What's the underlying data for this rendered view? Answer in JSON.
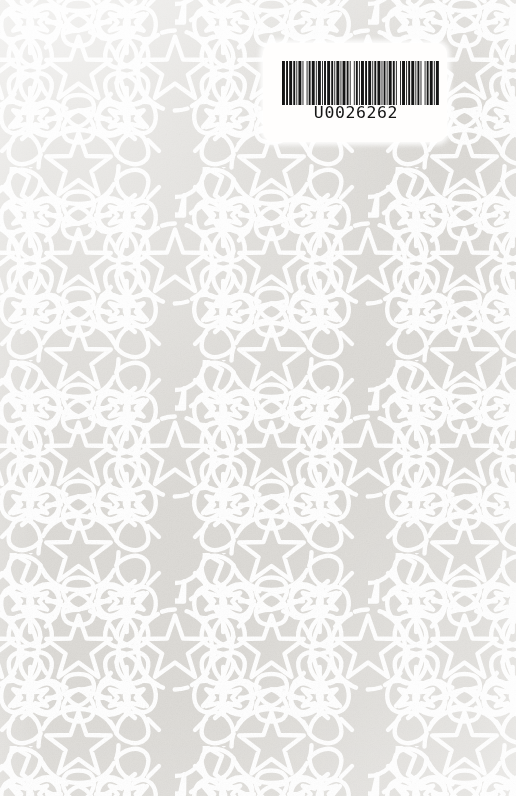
{
  "page": {
    "kind": "book-cover-scan",
    "width": 516,
    "height": 796
  },
  "colors": {
    "paper": "#dddbd7",
    "paper_light": "#e6e4e0",
    "pattern_line": "#ffffff",
    "label_background": "#fffefd",
    "barcode_ink": "#151515"
  },
  "barcode_label": {
    "name": "library-barcode-label",
    "number": "U0026262",
    "prefix_letter": "U",
    "digits": "0026262",
    "symbology": "code-39",
    "bar_widths": [
      3,
      1,
      2,
      1,
      3,
      1,
      2,
      1,
      1,
      1,
      3,
      1,
      1,
      3,
      1,
      1,
      2,
      1,
      3,
      1,
      1,
      1,
      3,
      1,
      1,
      1,
      2,
      1,
      3,
      1,
      2,
      1,
      1,
      1,
      3,
      1,
      1,
      1,
      3,
      1,
      2,
      1,
      1,
      3,
      1,
      1,
      2,
      1,
      1,
      1,
      3,
      1,
      2,
      1,
      3,
      1,
      1,
      1,
      2,
      1,
      3,
      1,
      1,
      1,
      2,
      1,
      1,
      1,
      3,
      1,
      2,
      1,
      1,
      3,
      1,
      1,
      3,
      1,
      1,
      1,
      2,
      1,
      3,
      1,
      1,
      1,
      2,
      1,
      1,
      3,
      1,
      1,
      2,
      1,
      3,
      1,
      1,
      1,
      3
    ]
  },
  "pattern": {
    "name": "girih-decagonal-rosette",
    "description": "Interlaced ten-pointed star rosettes with petal and six-point star fillers",
    "repeat_x": 193,
    "repeat_y": 193,
    "stroke_width": 4.4,
    "star_points": 10,
    "filler_star_points": 6
  },
  "chart_data": {
    "type": "table",
    "categories": [
      "Label value"
    ],
    "values": [
      "U0026262"
    ]
  }
}
